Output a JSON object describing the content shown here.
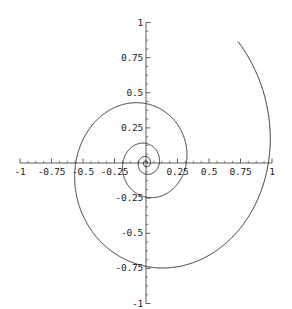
{
  "chart_data": {
    "type": "line",
    "title": "",
    "subtitle": "",
    "xlabel": "",
    "ylabel": "",
    "xlim": [
      -1,
      1
    ],
    "ylim": [
      -1,
      1
    ],
    "grid": false,
    "legend": null,
    "axes_style": "centered-cross",
    "curve_name": "logarithmic-spiral",
    "curve_equation": "r = a*exp(b*theta)",
    "curve_params": {
      "a": 0.0115,
      "b": 0.1765,
      "theta_start": 0.0,
      "theta_end": 26.0
    },
    "stroke_color": "#1a1a1a",
    "axis_color": "#4d4d4d",
    "x_ticks": [
      {
        "value": -1,
        "label": "-1"
      },
      {
        "value": -0.75,
        "label": "-0.75"
      },
      {
        "value": -0.5,
        "label": "-0.5"
      },
      {
        "value": -0.25,
        "label": "-0.25"
      },
      {
        "value": 0.25,
        "label": "0.25"
      },
      {
        "value": 0.5,
        "label": "0.5"
      },
      {
        "value": 0.75,
        "label": "0.75"
      },
      {
        "value": 1,
        "label": "1"
      }
    ],
    "y_ticks": [
      {
        "value": 1,
        "label": "1"
      },
      {
        "value": 0.75,
        "label": "0.75"
      },
      {
        "value": 0.5,
        "label": "0.5"
      },
      {
        "value": 0.25,
        "label": "0.25"
      },
      {
        "value": -0.25,
        "label": "-0.25"
      },
      {
        "value": -0.5,
        "label": "-0.5"
      },
      {
        "value": -0.75,
        "label": "-0.75"
      },
      {
        "value": -1,
        "label": "-1"
      }
    ],
    "minor_ticks_per_interval": 4,
    "annotations": [
      {
        "note": "spiral peak",
        "x": -0.07,
        "y": 0.31
      },
      {
        "note": "x-axis crossing of outer arm",
        "x": -0.75,
        "y": 0.0
      },
      {
        "note": "curve tail exits plot",
        "x": -0.93,
        "y": -0.99
      },
      {
        "note": "spiral converges to origin",
        "x": 0.0,
        "y": 0.0
      }
    ]
  }
}
